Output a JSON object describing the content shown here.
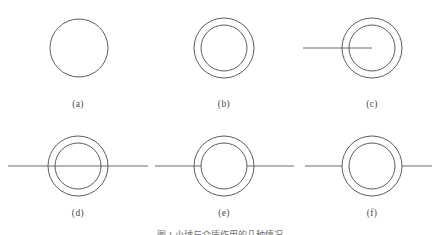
{
  "figure": {
    "caption": "图 1  小球与介质作用的几种情况",
    "caption_top": 228,
    "stroke_color": "#4a4a4a",
    "line_color": "#5a5a5a",
    "background": "#ffffff",
    "stroke_width": 0.9,
    "panels": [
      {
        "id": "a",
        "label": "(a)",
        "label_x": 78,
        "label_y": 99,
        "cx": 79,
        "cy": 48,
        "outer_r": 29,
        "inner_r": 0,
        "circles": 1,
        "line": "none",
        "line_x1": 0,
        "line_x2": 0,
        "gap_left": 0,
        "gap_right": 0
      },
      {
        "id": "b",
        "label": "(b)",
        "label_x": 224,
        "label_y": 99,
        "cx": 224,
        "cy": 48,
        "outer_r": 30,
        "inner_r": 23,
        "circles": 2,
        "line": "none",
        "line_x1": 0,
        "line_x2": 0,
        "gap_left": 0,
        "gap_right": 0
      },
      {
        "id": "c",
        "label": "(c)",
        "label_x": 372,
        "label_y": 99,
        "cx": 372,
        "cy": 48,
        "outer_r": 30,
        "inner_r": 23,
        "circles": 2,
        "line": "left-to-center",
        "line_x1": 303,
        "line_x2": 372,
        "gap_left": 0,
        "gap_right": 0
      },
      {
        "id": "d",
        "label": "(d)",
        "label_x": 78,
        "label_y": 208,
        "cx": 78,
        "cy": 166,
        "outer_r": 30,
        "inner_r": 23,
        "circles": 2,
        "line": "through",
        "line_x1": 8,
        "line_x2": 148,
        "gap_left": 0,
        "gap_right": 0
      },
      {
        "id": "e",
        "label": "(e)",
        "label_x": 224,
        "label_y": 208,
        "cx": 224,
        "cy": 166,
        "outer_r": 30,
        "inner_r": 23,
        "circles": 2,
        "line": "broken-at-inner",
        "line_x1": 155,
        "line_x2": 294,
        "gap_left": 201,
        "gap_right": 247
      },
      {
        "id": "f",
        "label": "(f)",
        "label_x": 372,
        "label_y": 208,
        "cx": 372,
        "cy": 166,
        "outer_r": 30,
        "inner_r": 23,
        "circles": 2,
        "line": "broken-at-outer",
        "line_x1": 305,
        "line_x2": 432,
        "gap_left": 342,
        "gap_right": 402
      }
    ]
  },
  "chart_data": {
    "type": "diagram",
    "title": "图 1  小球与介质作用的几种情况",
    "subfigures": [
      {
        "label": "(a)",
        "description": "single circle, no line",
        "circle_count": 1,
        "line_present": false
      },
      {
        "label": "(b)",
        "description": "two concentric circles, no line",
        "circle_count": 2,
        "line_present": false
      },
      {
        "label": "(c)",
        "description": "two concentric circles with horizontal line entering from left and terminating at center",
        "circle_count": 2,
        "line_present": true,
        "line_type": "left-to-center"
      },
      {
        "label": "(d)",
        "description": "two concentric circles with continuous horizontal line passing fully through",
        "circle_count": 2,
        "line_present": true,
        "line_type": "through"
      },
      {
        "label": "(e)",
        "description": "two concentric circles with horizontal line broken at the inner circle",
        "circle_count": 2,
        "line_present": true,
        "line_type": "broken-at-inner"
      },
      {
        "label": "(f)",
        "description": "two concentric circles with horizontal line broken at the outer circle",
        "circle_count": 2,
        "line_present": true,
        "line_type": "broken-at-outer"
      }
    ]
  }
}
